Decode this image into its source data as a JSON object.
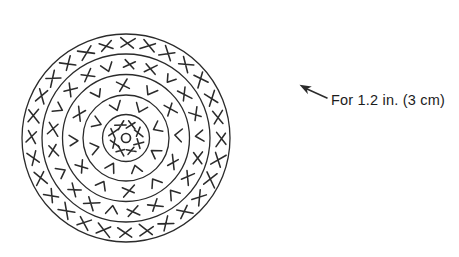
{
  "colors": {
    "ink": "#2b2b2b",
    "text": "#1c1c1c",
    "background": "#ffffff"
  },
  "annotation": {
    "label": "For 1.2 in. (3 cm)"
  },
  "diagram": {
    "type": "crochet-stitch-chart",
    "center_ring": {
      "symbol": "ring",
      "radius": 4.5
    },
    "round_circles": [
      23.5,
      43,
      63.5,
      84,
      104
    ],
    "rounds": [
      {
        "round": 1,
        "symbol": "x-around-center-ring",
        "symbol_radius": 13.5,
        "count": 8,
        "sequence": [
          "x"
        ],
        "start_angle": -68,
        "symbol_size": 8.5
      },
      {
        "round": 2,
        "symbol": "v-chevrons",
        "symbol_radius": 33,
        "count": 8,
        "sequence": [
          "v"
        ],
        "start_angle": 27,
        "symbol_size": 11.5
      },
      {
        "round": 3,
        "symbol": "x-v-alternating",
        "symbol_radius": 53,
        "count": 12,
        "sequence": [
          "x",
          "v"
        ],
        "start_angle": 27,
        "symbol_size": 11.5
      },
      {
        "round": 4,
        "symbol": "x-x-v-repeat",
        "symbol_radius": 73.5,
        "count": 21,
        "sequence": [
          "x",
          "x",
          "v"
        ],
        "start_angle": 66.7,
        "symbol_size": 11.5
      },
      {
        "round": 5,
        "symbol": "x-all-around",
        "symbol_radius": 94.5,
        "count": 28,
        "sequence": [
          "x"
        ],
        "start_angle": 270.6,
        "symbol_size": 13
      }
    ],
    "layout": {
      "cx": 126,
      "cy": 138,
      "circle_stroke": 1.3,
      "symbol_stroke": 1.55
    }
  }
}
